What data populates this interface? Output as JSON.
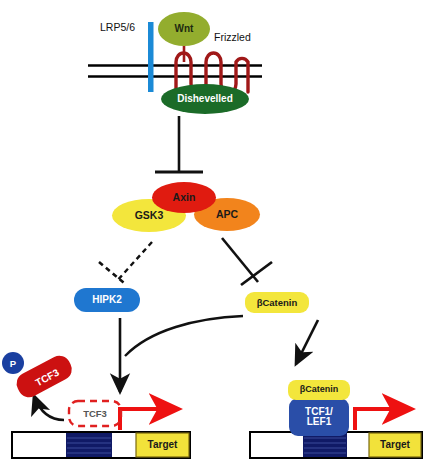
{
  "diagram": {
    "type": "biological-signaling-pathway"
  },
  "receptors": {
    "lrp56_label": "LRP5/6",
    "lrp56_color": "#1b8ad6",
    "frizzled_label": "Frizzled",
    "frizzled_color": "#a01818",
    "membrane_color": "#000000"
  },
  "ligand": {
    "wnt_label": "Wnt",
    "wnt_fill": "#93ad2e",
    "wnt_text_color": "#1d2a10",
    "stalk_color": "#a01818"
  },
  "transducer": {
    "dishevelled_label": "Dishevelled",
    "dishevelled_fill": "#1b6b28",
    "dishevelled_text_color": "#ffffff"
  },
  "destruction_complex": {
    "gsk3_label": "GSK3",
    "gsk3_fill": "#f3e63c",
    "gsk3_text_color": "#2a2a0a",
    "axin_label": "Axin",
    "axin_fill": "#e01b10",
    "axin_text_color": "#2a0a0a",
    "apc_label": "APC",
    "apc_fill": "#f2841c",
    "apc_text_color": "#2a1405"
  },
  "kinases": {
    "hipk2_label": "HIPK2",
    "hipk2_fill": "#1f77d0",
    "hipk2_text_color": "#ffffff"
  },
  "effectors": {
    "bcatenin_label": "βCatenin",
    "bcatenin_fill": "#f3e63c",
    "bcatenin_text_color": "#2a2a0a",
    "bcatenin_nuclear_label": "βCatenin"
  },
  "tcf3": {
    "phospho_label": "TCF3",
    "phospho_fill": "#cc1111",
    "phospho_text_color": "#ffffff",
    "phosphate_label": "P",
    "phosphate_fill": "#1a3fa0",
    "phosphate_text_color": "#ffffff",
    "repressor_label": "TCF3",
    "repressor_border_color": "#e02020",
    "repressor_text_color": "#555555"
  },
  "nucleus": {
    "tcf1lef1_label": "TCF1/\nLEF1",
    "tcf1lef1_line1": "TCF1/",
    "tcf1lef1_line2": "LEF1",
    "tcf1lef1_fill": "#2a4ea8",
    "tcf1lef1_text_color": "#ffffff"
  },
  "dna_left": {
    "target_label": "Target",
    "target_fill": "#f2e23a",
    "target_text_color": "#2a2a0a",
    "promoter_fill": "#101a66",
    "backbone_fill": "#ffffff",
    "border_color": "#000000",
    "transcription_arrow_color": "#ee1111"
  },
  "dna_right": {
    "target_label": "Target",
    "target_fill": "#f2e23a",
    "target_text_color": "#2a2a0a",
    "promoter_fill": "#101a66",
    "backbone_fill": "#ffffff",
    "border_color": "#000000",
    "transcription_arrow_color": "#ee1111"
  },
  "connectors": {
    "dsh_inhibits_complex": "inhibition",
    "complex_inhibits_hipk2": "dashed-inhibition",
    "complex_inhibits_bcatenin": "inhibition",
    "hipk2_to_tcf3": "activation",
    "bcatenin_to_nucleus": "activation",
    "tcf3_release": "activation"
  }
}
